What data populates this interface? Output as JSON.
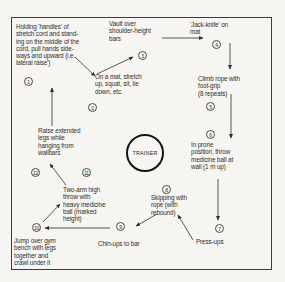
{
  "diagram": {
    "center_label": "TRAINER",
    "stations": [
      {
        "num": "1",
        "label": "Holding 'handles' of\nstretch cord and stand-\ning on the middle of the\ncord, pull hands side-\nways and upward (i.e.\nlateral raise')"
      },
      {
        "num": "2",
        "label": "On a mat, stretch\nup, squat, sit, lie\ndown, etc."
      },
      {
        "num": "3",
        "label": "Vault over\nshoulder-height\nbars"
      },
      {
        "num": "4",
        "label": "'Jack-knife' on\nmat"
      },
      {
        "num": "5",
        "label": "Climb rope with\nfoot-grip\n(8 repeats)"
      },
      {
        "num": "6",
        "label": "In prone\nposition, throw\nmedicine ball at\nwall (1 m up)"
      },
      {
        "num": "7",
        "label": "Press-ups"
      },
      {
        "num": "8",
        "label": "Skipping with\nrope (with\nrebound)"
      },
      {
        "num": "9",
        "label": "Chin-ups to bar"
      },
      {
        "num": "10",
        "label": "Jump over gym\nbench with legs\ntogether and\ncrawl under it"
      },
      {
        "num": "11",
        "label": "Two-arm high\nthrow with\nheavy medicine\nball (marked\nheight)"
      },
      {
        "num": "12",
        "label": "Raise extended\nlegs while\nhanging from\nwallbars"
      }
    ],
    "flow_order": [
      "1",
      "2",
      "3",
      "4",
      "5",
      "6",
      "7",
      "8",
      "9",
      "10",
      "11",
      "12",
      "1"
    ],
    "colors": {
      "paper": "#f6f5f1",
      "ink": "#2e2e2e"
    }
  }
}
